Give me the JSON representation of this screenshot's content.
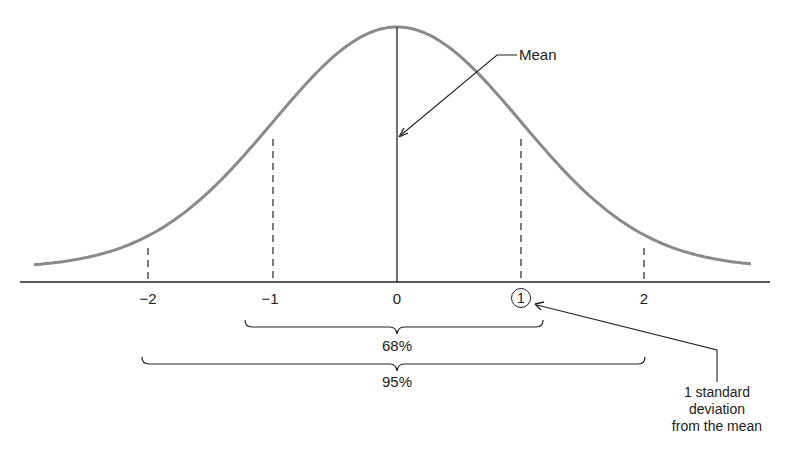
{
  "chart_data": {
    "type": "line",
    "title": "",
    "xlabel": "",
    "ylabel": "",
    "x_ticks": [
      "−2",
      "−1",
      "0",
      "1",
      "2"
    ],
    "x_tick_values": [
      -2,
      -1,
      0,
      1,
      2
    ],
    "highlighted_tick": "1",
    "curve": "normal density, mean 0, sd 1",
    "xlim": [
      -2.9,
      2.9
    ],
    "annotations": [
      {
        "text": "Mean",
        "points_to": 0
      },
      {
        "text": "1 standard deviation from the mean",
        "points_to": 1
      },
      {
        "text": "68%",
        "range": [
          -1,
          1
        ]
      },
      {
        "text": "95%",
        "range": [
          -2,
          2
        ]
      }
    ],
    "grid": false,
    "legend": false
  },
  "labels": {
    "ticks": [
      {
        "text": "−2",
        "x": 148
      },
      {
        "text": "−1",
        "x": 273
      },
      {
        "text": "0",
        "x": 397
      },
      {
        "text": "1",
        "x": 521
      },
      {
        "text": "2",
        "x": 644
      }
    ],
    "mean": "Mean",
    "pct68": "68%",
    "pct95": "95%",
    "sd_note_line1": "1 standard deviation",
    "sd_note_line2": "from the mean"
  },
  "colors": {
    "curve": "#8a8a8a",
    "ink": "#222222"
  }
}
